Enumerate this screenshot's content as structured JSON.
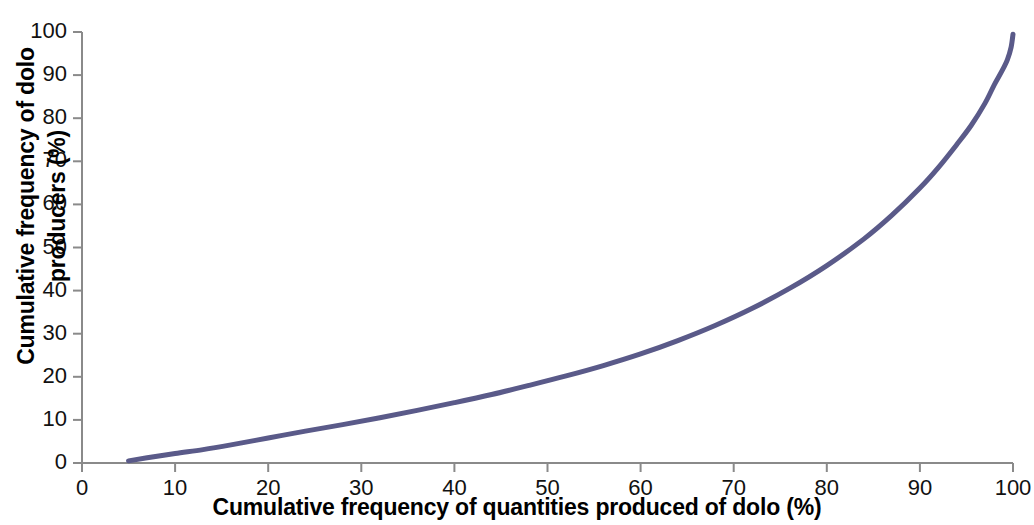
{
  "chart_data": {
    "type": "line",
    "title": "",
    "xlabel": "Cumulative frequency of quantities produced of dolo (%)",
    "ylabel_line1": "Cumulative frequency of dolo",
    "ylabel_line2": "producers (%)",
    "ylabel": "Cumulative frequency of dolo producers (%)",
    "xlim": [
      0,
      100
    ],
    "ylim": [
      0,
      100
    ],
    "grid": false,
    "legend": "none",
    "series_color": "#5A5A89",
    "axis_color": "#808080",
    "x_ticks": [
      0,
      10,
      20,
      30,
      40,
      50,
      60,
      70,
      80,
      90,
      100
    ],
    "y_ticks": [
      0,
      10,
      20,
      30,
      40,
      50,
      60,
      70,
      80,
      90,
      100
    ],
    "x_tick_labels": [
      "0",
      "10",
      "20",
      "30",
      "40",
      "50",
      "60",
      "70",
      "80",
      "90",
      "100"
    ],
    "y_tick_labels": [
      "0",
      "10",
      "20",
      "30",
      "40",
      "50",
      "60",
      "70",
      "80",
      "90",
      "100"
    ],
    "series": [
      {
        "name": "Lorenz curve of dolo production",
        "x": [
          5,
          7,
          10,
          13,
          16,
          20,
          24,
          28,
          32,
          36,
          40,
          44,
          48,
          52,
          56,
          60,
          64,
          68,
          72,
          76,
          80,
          84,
          87,
          90,
          92,
          94,
          95.5,
          97,
          98,
          98.8,
          99.4,
          99.8,
          100
        ],
        "y": [
          0.5,
          1.2,
          2.2,
          3.1,
          4.2,
          5.8,
          7.4,
          8.9,
          10.5,
          12.2,
          14.0,
          15.9,
          18.0,
          20.2,
          22.6,
          25.3,
          28.4,
          31.9,
          35.9,
          40.5,
          45.8,
          52.0,
          57.5,
          63.8,
          68.6,
          74.0,
          78.3,
          83.5,
          87.8,
          90.9,
          93.6,
          96.5,
          99.5
        ]
      }
    ]
  },
  "plot_geometry": {
    "left_px": 82,
    "right_px": 1013,
    "top_px": 32,
    "bottom_px": 463
  }
}
